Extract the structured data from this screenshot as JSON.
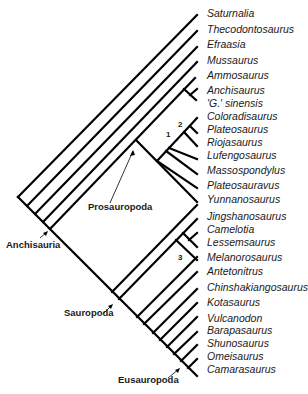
{
  "taxa": [
    {
      "name": "Saturnalia",
      "y": 13
    },
    {
      "name": "Thecodontosaurus",
      "y": 29
    },
    {
      "name": "Efraasia",
      "y": 44
    },
    {
      "name": "Mussaurus",
      "y": 60
    },
    {
      "name": "Ammosaurus",
      "y": 75
    },
    {
      "name": "Anchisaurus",
      "y": 90
    },
    {
      "name": "'G.' sinensis",
      "y": 103
    },
    {
      "name": "Coloradisaurus",
      "y": 116
    },
    {
      "name": "Plateosaurus",
      "y": 129
    },
    {
      "name": "Riojasaurus",
      "y": 142
    },
    {
      "name": "Lufengosaurus",
      "y": 155
    },
    {
      "name": "Massospondylus",
      "y": 170
    },
    {
      "name": "Plateosauravus",
      "y": 185
    },
    {
      "name": "Yunnanosaurus",
      "y": 199
    },
    {
      "name": "Jingshanosaurus",
      "y": 216
    },
    {
      "name": "Camelotia",
      "y": 229
    },
    {
      "name": "Lessemsaurus",
      "y": 242
    },
    {
      "name": "Melanorosaurus",
      "y": 257
    },
    {
      "name": "Antetonitrus",
      "y": 271
    },
    {
      "name": "Chinshakiangosaurus",
      "y": 287
    },
    {
      "name": "Kotasaurus",
      "y": 302
    },
    {
      "name": "Vulcanodon",
      "y": 318
    },
    {
      "name": "Barapasaurus",
      "y": 330
    },
    {
      "name": "Shunosaurus",
      "y": 343
    },
    {
      "name": "Omeisaurus",
      "y": 356
    },
    {
      "name": "Camarasaurus",
      "y": 369
    }
  ],
  "clades": {
    "prosauropoda": "Prosauropoda",
    "anchisauria": "Anchisauria",
    "sauropoda": "Sauropoda",
    "eusauropoda": "Eusauropoda"
  },
  "nodes": {
    "n1": "1",
    "n2": "2",
    "n3": "3"
  }
}
